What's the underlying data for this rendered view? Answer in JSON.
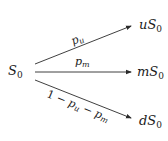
{
  "diagram": {
    "type": "trinomial-tree",
    "root": {
      "base": "S",
      "subscript": "0"
    },
    "branches": [
      {
        "id": "up",
        "probability": {
          "base": "p",
          "subscript": "u"
        },
        "target": {
          "prefix": "u",
          "base": "S",
          "subscript": "0"
        }
      },
      {
        "id": "middle",
        "probability": {
          "base": "p",
          "subscript": "m"
        },
        "target": {
          "prefix": "m",
          "base": "S",
          "subscript": "0"
        }
      },
      {
        "id": "down",
        "probability": {
          "part1": "1 − ",
          "base1": "p",
          "subscript1": "u",
          "part2": " − ",
          "base2": "p",
          "subscript2": "m"
        },
        "target": {
          "prefix": "d",
          "base": "S",
          "subscript": "0"
        }
      }
    ],
    "colors": {
      "line": "#2a2a2a",
      "text": "#1a1a1a",
      "background": "#ffffff"
    }
  }
}
